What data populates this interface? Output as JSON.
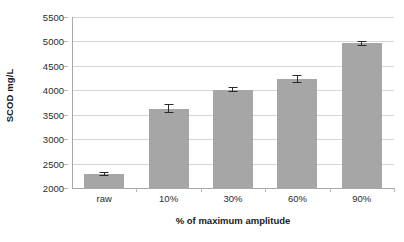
{
  "chart_data": {
    "type": "bar",
    "title": "",
    "subtitle": "",
    "xlabel": "% of maximum amplitude",
    "ylabel": "SCOD mg/L",
    "categories": [
      "raw",
      "10%",
      "30%",
      "60%",
      "90%"
    ],
    "values": [
      2290,
      3620,
      4015,
      4230,
      4960
    ],
    "errors": [
      40,
      90,
      45,
      75,
      50
    ],
    "series": [
      {
        "name": "SCOD",
        "values": [
          2290,
          3620,
          4015,
          4230,
          4960
        ],
        "errors": [
          40,
          90,
          45,
          75,
          50
        ],
        "color": "#a6a6a6"
      }
    ],
    "ylim": [
      2000,
      5500
    ],
    "yticks": [
      2000,
      2500,
      3000,
      3500,
      4000,
      4500,
      5000,
      5500
    ],
    "ytick_labels": [
      "2000",
      "2500",
      "3000",
      "3500",
      "4000",
      "4500",
      "5000",
      "5500"
    ],
    "grid": "horizontal",
    "legend": "none",
    "bar_color": "#a6a6a6",
    "error_bar_color": "#2a2a2a",
    "gridline_color": "#d6d6d6",
    "axis_color": "#a9a9a9",
    "background_color": "#ffffff"
  }
}
